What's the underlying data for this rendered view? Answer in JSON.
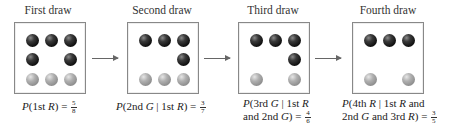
{
  "stages": [
    {
      "title": "First draw",
      "balls": {
        "row1": [
          "R",
          "R",
          "R"
        ],
        "row2": [
          "R",
          "",
          "R"
        ],
        "row3": [
          "G",
          "G",
          "G"
        ]
      },
      "caption": {
        "line1_pre": "P(1st ",
        "line1_var": "R",
        "line1_post": ") = ",
        "line2": "",
        "num": "5",
        "den": "8"
      }
    },
    {
      "title": "Second draw",
      "balls": {
        "row1": [
          "R",
          "R",
          "R"
        ],
        "row2": [
          "",
          "",
          "R"
        ],
        "row3": [
          "G",
          "G",
          "G"
        ]
      },
      "caption": {
        "text": "P(2nd G | 1st R) = ",
        "num": "3",
        "den": "7"
      }
    },
    {
      "title": "Third draw",
      "balls": {
        "row1": [
          "R",
          "R",
          "R"
        ],
        "row2": [
          "",
          "",
          "R"
        ],
        "row3": [
          "G",
          "",
          "G"
        ]
      },
      "caption": {
        "line1": "P(3rd G | 1st R",
        "line2": "and 2nd G) = ",
        "num": "4",
        "den": "6"
      }
    },
    {
      "title": "Fourth draw",
      "balls": {
        "row1": [
          "R",
          "R",
          "R"
        ],
        "row2": [
          "",
          "",
          ""
        ],
        "row3": [
          "G",
          "",
          "G"
        ]
      },
      "caption": {
        "line1": "P(4th R | 1st R and",
        "line2": "2nd G and 3rd R) = ",
        "num": "3",
        "den": "5"
      }
    }
  ],
  "colors": {
    "red_ball": "#111111",
    "green_ball": "#999999",
    "box_border": "#888888",
    "arrow": "#666666"
  }
}
